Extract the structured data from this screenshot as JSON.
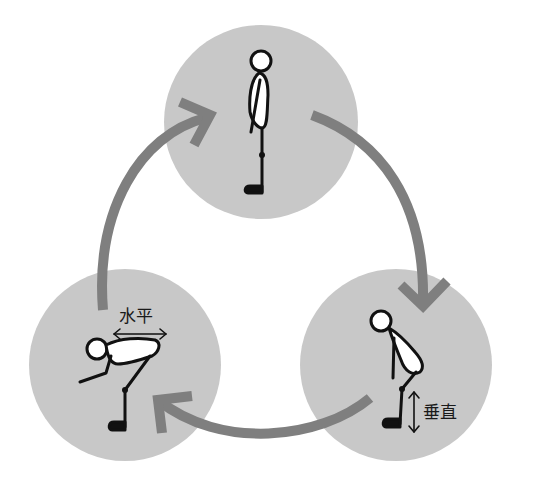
{
  "diagram": {
    "type": "cycle",
    "colors": {
      "circle_fill": "#c8c8c8",
      "arrow": "#7f7f7f",
      "figure_stroke": "#111111",
      "figure_fill": "#ffffff"
    },
    "stages": [
      {
        "id": "standing",
        "label": ""
      },
      {
        "id": "bend-knees",
        "label": "垂直"
      },
      {
        "id": "bend-forward",
        "label": "水平"
      }
    ],
    "labels": {
      "vertical": "垂直",
      "horizontal": "水平"
    },
    "arrows": [
      {
        "from": "standing",
        "to": "bend-knees"
      },
      {
        "from": "bend-knees",
        "to": "bend-forward"
      },
      {
        "from": "bend-forward",
        "to": "standing"
      }
    ]
  }
}
